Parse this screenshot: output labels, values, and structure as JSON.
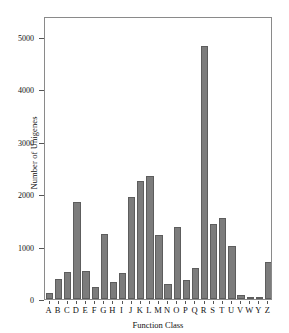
{
  "chart_data": {
    "type": "bar",
    "title": "",
    "subtitle": "",
    "xlabel": "Function Class",
    "ylabel": "Number of Unigenes",
    "categories": [
      "A",
      "B",
      "C",
      "D",
      "E",
      "F",
      "G",
      "H",
      "I",
      "J",
      "K",
      "L",
      "M",
      "N",
      "O",
      "P",
      "Q",
      "R",
      "S",
      "T",
      "U",
      "V",
      "W",
      "Y",
      "Z"
    ],
    "values": [
      110,
      390,
      520,
      1860,
      540,
      230,
      1240,
      320,
      500,
      1950,
      2260,
      2340,
      1230,
      290,
      1380,
      370,
      590,
      4830,
      1440,
      1540,
      1020,
      70,
      10,
      5,
      710
    ],
    "ylim": [
      0,
      5400
    ],
    "xlim_note": "categorical",
    "yticks": [
      0,
      1000,
      2000,
      3000,
      4000,
      5000
    ],
    "ytick_labels": [
      "0",
      "1000",
      "2000",
      "3000",
      "4000",
      "5000"
    ],
    "grid": false,
    "legend": null,
    "legend_position": "none",
    "annotations": [],
    "bar_color": "#7c7c7c",
    "bar_edge_color": "#5d5d5d",
    "frame_color": "#8a8a8a",
    "background_color": "#ffffff"
  }
}
